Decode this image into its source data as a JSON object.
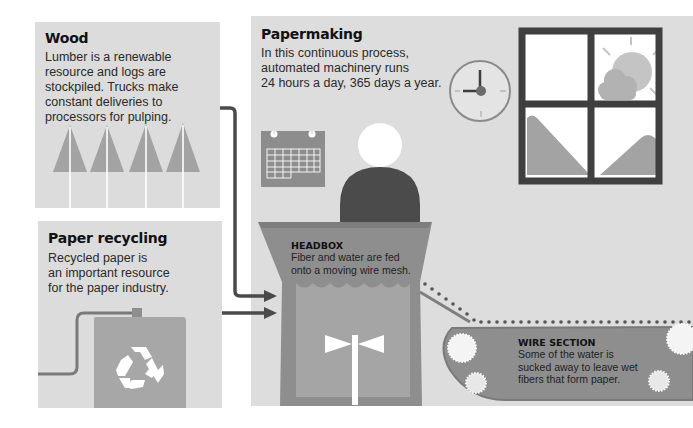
{
  "wood": {
    "title": "Wood",
    "description": "Lumber is a renewable resource and logs are stockpiled. Trucks make constant deliveries to processors for pulping.",
    "lines": [
      "Lumber is a renewable",
      "resource and logs are",
      "stockpiled. Trucks make",
      "constant deliveries to",
      "processors for pulping."
    ],
    "icon": "tree-icon",
    "tree_count": 4
  },
  "recycling": {
    "title": "Paper recycling",
    "description": "Recycled paper is an important resource for the paper industry.",
    "lines": [
      "Recycled paper is",
      "an important resource",
      "for the paper industry."
    ],
    "icon": "recycle-icon"
  },
  "papermaking": {
    "title": "Papermaking",
    "description": "In this continuous process, automated machinery runs 24 hours a day, 365 days a year.",
    "lines": [
      "In this continuous process,",
      "automated machinery runs",
      "24 hours a day, 365 days a year."
    ],
    "icons": [
      "calendar-icon",
      "clock-icon",
      "window-icon",
      "worker-icon"
    ]
  },
  "headbox": {
    "title": "HEADBOX",
    "lines": [
      "Fiber and water are fed",
      "onto a moving wire mesh."
    ]
  },
  "wire_section": {
    "title": "WIRE SECTION",
    "lines": [
      "Some of the water is",
      "sucked away to leave wet",
      "fibers that form paper."
    ]
  },
  "colors": {
    "panel_bg": "#dcdcdc",
    "dark": "#4a4a4a",
    "mid": "#a3a3a3",
    "machine": "#8e8e8e",
    "white": "#ffffff"
  }
}
